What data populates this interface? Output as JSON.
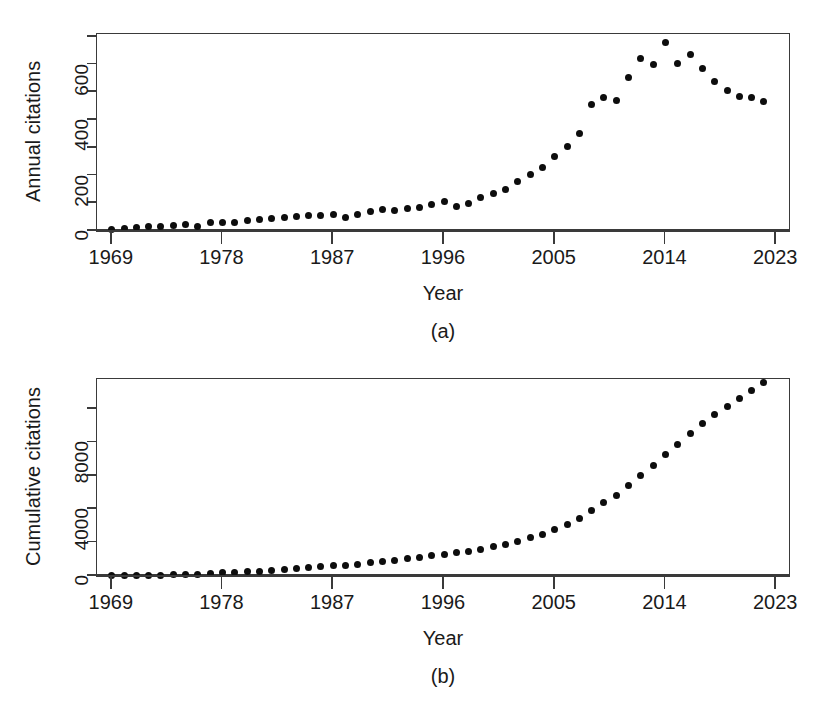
{
  "figure": {
    "background": "#ffffff",
    "point_color": "#0d0d0d",
    "axis_color": "#3a3a3a"
  },
  "panels": [
    {
      "tag": "(a)",
      "xlabel": "Year",
      "ylabel": "Annual citations",
      "x_ticks": [
        "1969",
        "1978",
        "1987",
        "1996",
        "2005",
        "2014",
        "2023"
      ],
      "y_ticks": [
        "0",
        "",
        "200",
        "",
        "400",
        "",
        "600",
        ""
      ]
    },
    {
      "tag": "(b)",
      "xlabel": "Year",
      "ylabel": "Cumulative citations",
      "x_ticks": [
        "1969",
        "1978",
        "1987",
        "1996",
        "2005",
        "2014",
        "2023"
      ],
      "y_ticks": [
        "0",
        "",
        "4000",
        "",
        "8000",
        ""
      ]
    }
  ],
  "chart_data": [
    {
      "type": "scatter",
      "title": "",
      "panel": "(a)",
      "xlabel": "Year",
      "ylabel": "Annual citations",
      "xlim": [
        1967.8,
        2024.2
      ],
      "ylim": [
        0,
        710
      ],
      "grid": false,
      "legend": null,
      "x_tick_values": [
        1969,
        1978,
        1987,
        1996,
        2005,
        2014,
        2023
      ],
      "x_tick_labels": [
        "1969",
        "1978",
        "1987",
        "1996",
        "2005",
        "2014",
        "2023"
      ],
      "y_tick_values": [
        0,
        100,
        200,
        300,
        400,
        500,
        600,
        700
      ],
      "y_tick_labels": [
        "0",
        "",
        "200",
        "",
        "400",
        "",
        "600",
        ""
      ],
      "x": [
        1969,
        1970,
        1971,
        1972,
        1973,
        1974,
        1975,
        1976,
        1977,
        1978,
        1979,
        1980,
        1981,
        1982,
        1983,
        1984,
        1985,
        1986,
        1987,
        1988,
        1989,
        1990,
        1991,
        1992,
        1993,
        1994,
        1995,
        1996,
        1997,
        1998,
        1999,
        2000,
        2001,
        2002,
        2003,
        2004,
        2005,
        2006,
        2007,
        2008,
        2009,
        2010,
        2011,
        2012,
        2013,
        2014,
        2015,
        2016,
        2017,
        2018,
        2019,
        2020,
        2021,
        2022
      ],
      "values": [
        6,
        9,
        12,
        15,
        17,
        20,
        22,
        18,
        30,
        32,
        29,
        38,
        43,
        46,
        50,
        52,
        55,
        57,
        58,
        48,
        60,
        72,
        78,
        75,
        80,
        83,
        95,
        105,
        90,
        100,
        120,
        135,
        150,
        180,
        205,
        230,
        270,
        305,
        350,
        455,
        480,
        470,
        555,
        620,
        600,
        680,
        605,
        635,
        585,
        540,
        505,
        485,
        480,
        465
      ],
      "series": [
        {
          "name": "Annual citations",
          "values": [
            6,
            9,
            12,
            15,
            17,
            20,
            22,
            18,
            30,
            32,
            29,
            38,
            43,
            46,
            50,
            52,
            55,
            57,
            58,
            48,
            60,
            72,
            78,
            75,
            80,
            83,
            95,
            105,
            90,
            100,
            120,
            135,
            150,
            180,
            205,
            230,
            270,
            305,
            350,
            455,
            480,
            470,
            555,
            620,
            600,
            680,
            605,
            635,
            585,
            540,
            505,
            485,
            480,
            465
          ]
        }
      ]
    },
    {
      "type": "scatter",
      "title": "",
      "panel": "(b)",
      "xlabel": "Year",
      "ylabel": "Cumulative citations",
      "xlim": [
        1967.8,
        2024.2
      ],
      "ylim": [
        0,
        11800
      ],
      "grid": false,
      "legend": null,
      "x_tick_values": [
        1969,
        1978,
        1987,
        1996,
        2005,
        2014,
        2023
      ],
      "x_tick_labels": [
        "1969",
        "1978",
        "1987",
        "1996",
        "2005",
        "2014",
        "2023"
      ],
      "y_tick_values": [
        0,
        2000,
        4000,
        6000,
        8000,
        10000
      ],
      "y_tick_labels": [
        "0",
        "",
        "4000",
        "",
        "8000",
        ""
      ],
      "x": [
        1969,
        1970,
        1971,
        1972,
        1973,
        1974,
        1975,
        1976,
        1977,
        1978,
        1979,
        1980,
        1981,
        1982,
        1983,
        1984,
        1985,
        1986,
        1987,
        1988,
        1989,
        1990,
        1991,
        1992,
        1993,
        1994,
        1995,
        1996,
        1997,
        1998,
        1999,
        2000,
        2001,
        2002,
        2003,
        2004,
        2005,
        2006,
        2007,
        2008,
        2009,
        2010,
        2011,
        2012,
        2013,
        2014,
        2015,
        2016,
        2017,
        2018,
        2019,
        2020,
        2021,
        2022
      ],
      "values": [
        6,
        15,
        27,
        42,
        59,
        79,
        101,
        119,
        149,
        181,
        210,
        248,
        291,
        337,
        387,
        439,
        494,
        551,
        609,
        657,
        717,
        789,
        867,
        942,
        1022,
        1105,
        1200,
        1305,
        1395,
        1495,
        1615,
        1750,
        1900,
        2080,
        2285,
        2515,
        2785,
        3090,
        3440,
        3895,
        4375,
        4845,
        5400,
        6020,
        6620,
        7300,
        7905,
        8540,
        9125,
        9665,
        10170,
        10655,
        11135,
        11600
      ],
      "series": [
        {
          "name": "Cumulative citations",
          "values": [
            6,
            15,
            27,
            42,
            59,
            79,
            101,
            119,
            149,
            181,
            210,
            248,
            291,
            337,
            387,
            439,
            494,
            551,
            609,
            657,
            717,
            789,
            867,
            942,
            1022,
            1105,
            1200,
            1305,
            1395,
            1495,
            1615,
            1750,
            1900,
            2080,
            2285,
            2515,
            2785,
            3090,
            3440,
            3895,
            4375,
            4845,
            5400,
            6020,
            6620,
            7300,
            7905,
            8540,
            9125,
            9665,
            10170,
            10655,
            11135,
            11600
          ]
        }
      ]
    }
  ]
}
